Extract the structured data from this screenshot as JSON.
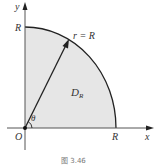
{
  "figure": {
    "caption": "图 3.46",
    "region_label": "D",
    "region_subscript": "R",
    "radius_label": "r = R",
    "angle_label": "θ",
    "origin_label": "O",
    "x_axis_label": "x",
    "y_axis_label": "y",
    "x_intercept_label": "R",
    "y_intercept_label": "R",
    "colors": {
      "region_fill": "#e6e6e6",
      "stroke": "#222222",
      "axis": "#555555"
    }
  }
}
